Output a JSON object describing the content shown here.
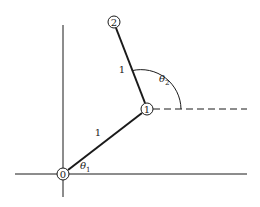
{
  "diagram": {
    "type": "two-link planar arm",
    "colors": {
      "ink": "#1a1a1a",
      "background": "#ffffff"
    },
    "joints": [
      {
        "id": "0",
        "label": "0",
        "x": 63,
        "y": 174
      },
      {
        "id": "1",
        "label": "1",
        "x": 147,
        "y": 109
      },
      {
        "id": "2",
        "label": "2",
        "x": 114,
        "y": 22
      }
    ],
    "links": [
      {
        "from": "0",
        "to": "1",
        "length_label": "1"
      },
      {
        "from": "1",
        "to": "2",
        "length_label": "1"
      }
    ],
    "angles": [
      {
        "symbol": "θ",
        "subscript": "1"
      },
      {
        "symbol": "θ",
        "subscript": "2"
      }
    ],
    "axes": {
      "horizontal": "x-axis",
      "vertical": "y-axis",
      "reference": "dashed horizontal at joint 1"
    }
  }
}
